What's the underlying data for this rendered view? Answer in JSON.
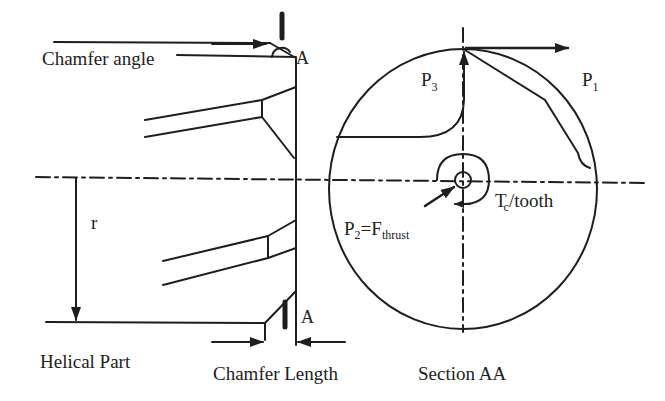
{
  "diagram": {
    "type": "drill-chamfer-force-diagram",
    "colors": {
      "ink": "#1e1e1e",
      "background": "#ffffff"
    },
    "left_view": {
      "labels": {
        "chamfer_angle": "Chamfer angle",
        "section_marker_top": "A",
        "section_marker_bottom": "A",
        "radius": "r",
        "helical_part": "Helical Part",
        "chamfer_length": "Chamfer Length"
      }
    },
    "section_view": {
      "title": "Section AA",
      "labels": {
        "p1_base": "P",
        "p1_sub": "1",
        "p3_base": "P",
        "p3_sub": "3",
        "p2_base": "P",
        "p2_sub": "2",
        "p2_eq": "=F",
        "p2_eq_sub": "thrust",
        "torque_base": "T",
        "torque_sub": "c",
        "torque_rest": "/tooth"
      }
    }
  }
}
